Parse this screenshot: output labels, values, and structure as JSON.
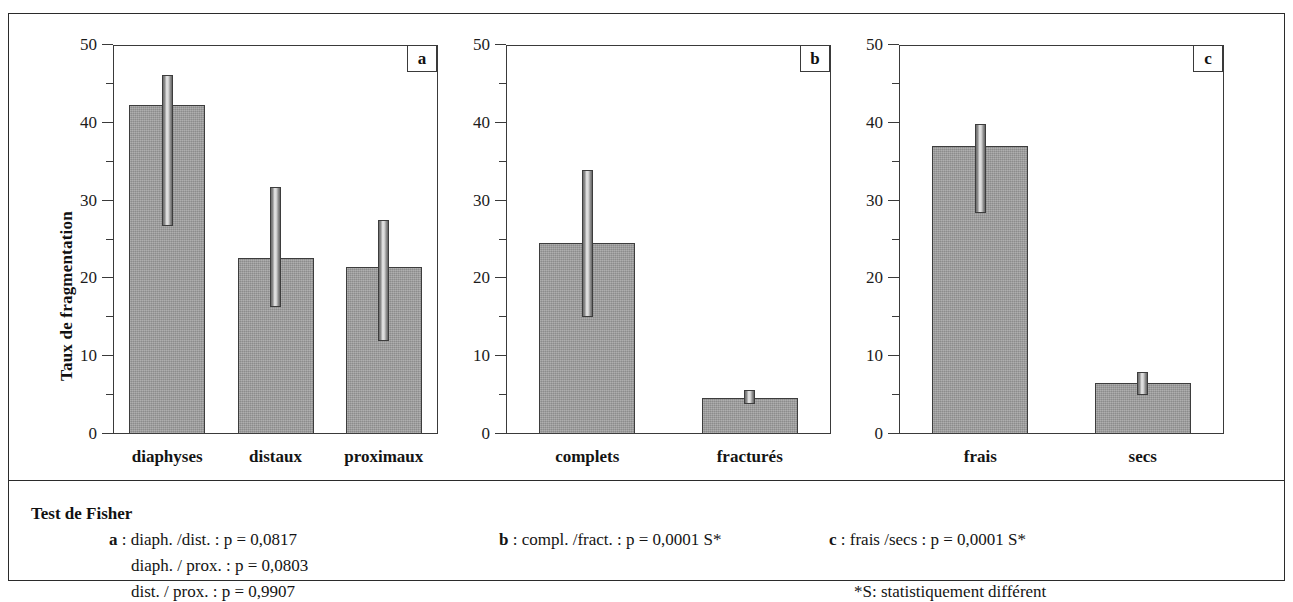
{
  "figure": {
    "ylabel": "Taux de fragmentation",
    "y_ticks": [
      "0",
      "10",
      "20",
      "30",
      "40",
      "50"
    ],
    "panel_tags": [
      "a",
      "b",
      "c"
    ]
  },
  "chart_data": [
    {
      "type": "bar",
      "panel": "a",
      "title": "",
      "xlabel": "",
      "ylabel": "Taux de fragmentation",
      "ylim": [
        0,
        50
      ],
      "yticks": [
        0,
        10,
        20,
        30,
        40,
        50
      ],
      "yticks_minor": [
        5,
        15,
        25,
        35,
        45
      ],
      "grid": false,
      "legend": "none",
      "categories": [
        "diaphyses",
        "distaux",
        "proximaux"
      ],
      "values": [
        42.3,
        22.6,
        21.5
      ],
      "error_low": [
        26.7,
        16.3,
        12.0
      ],
      "error_high": [
        46.2,
        31.8,
        27.5
      ]
    },
    {
      "type": "bar",
      "panel": "b",
      "title": "",
      "xlabel": "",
      "ylabel": "",
      "ylim": [
        0,
        50
      ],
      "yticks": [
        0,
        10,
        20,
        30,
        40,
        50
      ],
      "yticks_minor": [
        5,
        15,
        25,
        35,
        45
      ],
      "grid": false,
      "legend": "none",
      "categories": [
        "complets",
        "fracturés"
      ],
      "values": [
        24.5,
        4.6
      ],
      "error_low": [
        15.0,
        3.9
      ],
      "error_high": [
        33.9,
        5.6
      ]
    },
    {
      "type": "bar",
      "panel": "c",
      "title": "",
      "xlabel": "",
      "ylabel": "",
      "ylim": [
        0,
        50
      ],
      "yticks": [
        0,
        10,
        20,
        30,
        40,
        50
      ],
      "yticks_minor": [
        5,
        15,
        25,
        35,
        45
      ],
      "grid": false,
      "legend": "none",
      "categories": [
        "frais",
        "secs"
      ],
      "values": [
        37.0,
        6.5
      ],
      "error_low": [
        28.4,
        5.0
      ],
      "error_high": [
        39.9,
        8.0
      ]
    }
  ],
  "caption": {
    "title": "Test de Fisher",
    "column_a": [
      {
        "tag": "a",
        "text": " : diaph. /dist. : p = 0,0817"
      },
      {
        "tag": "",
        "text": "diaph. / prox. : p = 0,0803"
      },
      {
        "tag": "",
        "text": "dist. / prox. : p = 0,9907"
      }
    ],
    "column_b": [
      {
        "tag": "b",
        "text": " : compl. /fract. : p = 0,0001 S*"
      }
    ],
    "column_c": [
      {
        "tag": "c",
        "text": " : frais /secs : p = 0,0001 S*"
      },
      {
        "tag": "",
        "text": "*S: statistiquement différent"
      }
    ]
  }
}
